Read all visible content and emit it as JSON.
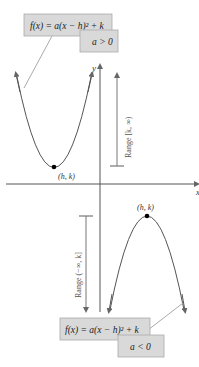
{
  "diagram": {
    "colors": {
      "curve": "#555555",
      "axis": "#555555",
      "label_box_fill": "#d9d9d9",
      "label_box_stroke": "#aaaaaa",
      "range_bar": "#777777",
      "vertex": "#000000"
    },
    "axes": {
      "y_label": "y",
      "x_label": "x"
    },
    "upper": {
      "formula_parts": {
        "f": "f",
        "x1": "(x) = ",
        "a": "a",
        "paren": "(x − h)",
        "exp": "2",
        "plus_k": " + k"
      },
      "formula": "f(x) = a(x − h)² + k",
      "condition": "a > 0",
      "vertex_label": "(h, k)",
      "range_label": "Range [k, ∞)",
      "opens": "up"
    },
    "lower": {
      "formula": "f(x) = a(x − h)² + k",
      "condition": "a < 0",
      "vertex_label": "(h, k)",
      "range_label": "Range (−∞, k]",
      "opens": "down"
    }
  }
}
